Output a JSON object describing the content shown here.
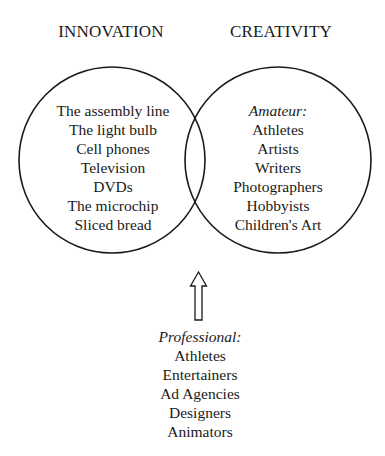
{
  "diagram": {
    "type": "venn",
    "sets": [
      {
        "id": "innovation",
        "title": "INNOVATION",
        "items": [
          "The assembly line",
          "The light bulb",
          "Cell phones",
          "Television",
          "DVDs",
          "The microchip",
          "Sliced bread"
        ]
      },
      {
        "id": "creativity",
        "title": "CREATIVITY",
        "label": "Amateur:",
        "items": [
          "Athletes",
          "Artists",
          "Writers",
          "Photographers",
          "Hobbyists",
          "Children's Art"
        ]
      }
    ],
    "overlap": {
      "pointer": "up-arrow",
      "label": "Professional:",
      "items": [
        "Athletes",
        "Entertainers",
        "Ad Agencies",
        "Designers",
        "Animators"
      ]
    },
    "colors": {
      "stroke": "#1a1a1a",
      "background": "#ffffff",
      "text": "#1a1a1a"
    }
  }
}
